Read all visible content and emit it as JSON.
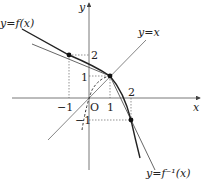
{
  "diagram": {
    "type": "function-graph",
    "axes": {
      "x_label": "x",
      "y_label": "y",
      "origin_label": "O"
    },
    "ticks": {
      "x_neg1": "−1",
      "x_1": "1",
      "x_2": "2",
      "y_2": "2",
      "y_1": "1",
      "y_neg1": "−1"
    },
    "curves": {
      "f_label": "y=f(x)",
      "finv_label": "y=f⁻¹(x)",
      "identity_label": "y=x"
    },
    "points": [
      {
        "name": "point-neg1-2",
        "x": -1,
        "y": 2
      },
      {
        "name": "point-1-1",
        "x": 1,
        "y": 1
      },
      {
        "name": "point-2-neg1",
        "x": 2,
        "y": -1
      }
    ]
  }
}
